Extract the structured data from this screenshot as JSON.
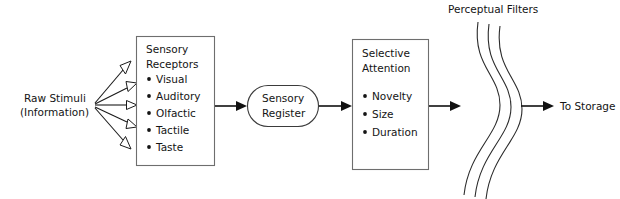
{
  "diagram": {
    "background_color": "#ffffff",
    "line_color": "#1a1a1a",
    "box_stroke_color": "#6e6e6e",
    "text_color": "#141414"
  },
  "source": {
    "label_line1": "Raw Stimuli",
    "label_line2": "(Information)",
    "arrow_count": "5",
    "arrowhead_style": "hollow-triangle"
  },
  "boxes": [
    {
      "id": "sensory-receptors",
      "heading_line1": "Sensory",
      "heading_line2": "Receptors",
      "items": [
        "Visual",
        "Auditory",
        "Olfactic",
        "Tactile",
        "Taste"
      ]
    },
    {
      "id": "selective-attention",
      "heading_line1": "Selective",
      "heading_line2": "Attention",
      "items": [
        "Novelty",
        "Size",
        "Duration"
      ]
    }
  ],
  "register": {
    "line1": "Sensory",
    "line2": "Register",
    "shape": "stadium"
  },
  "filters": {
    "label": "Perceptual Filters",
    "curve_count": "3"
  },
  "destination": {
    "label": "To Storage"
  }
}
